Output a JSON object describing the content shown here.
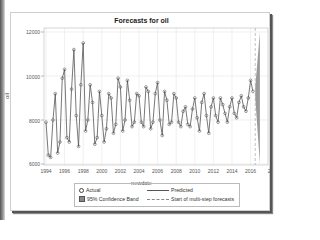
{
  "chart_data": {
    "type": "line",
    "title": "Forecasts for oil",
    "xlabel": "newdate",
    "ylabel": "oil",
    "ylim": [
      6000,
      12000
    ],
    "xlim": [
      1994,
      2018
    ],
    "y_ticks": [
      "6000",
      "8000",
      "10000",
      "12000"
    ],
    "x_ticks": [
      "1994",
      "1996",
      "1998",
      "2000",
      "2002",
      "2004",
      "2006",
      "2008",
      "2010",
      "2012",
      "2014",
      "2016",
      "2"
    ],
    "grid": true,
    "legend_position": "bottom",
    "legend": [
      "Actual",
      "Predicted",
      "95% Confidence Band",
      "Start of multi-step forecasts"
    ],
    "series": [
      {
        "name": "Actual",
        "style": "circle-markers",
        "x": [
          1994.0,
          1994.25,
          1994.5,
          1994.75,
          1995.0,
          1995.25,
          1995.5,
          1995.75,
          1996.0,
          1996.25,
          1996.5,
          1996.75,
          1997.0,
          1997.25,
          1997.5,
          1997.75,
          1998.0,
          1998.25,
          1998.5,
          1998.75,
          1999.0,
          1999.25,
          1999.5,
          1999.75,
          2000.0,
          2000.25,
          2000.5,
          2000.75,
          2001.0,
          2001.25,
          2001.5,
          2001.75,
          2002.0,
          2002.25,
          2002.5,
          2002.75,
          2003.0,
          2003.25,
          2003.5,
          2003.75,
          2004.0,
          2004.25,
          2004.5,
          2004.75,
          2005.0,
          2005.25,
          2005.5,
          2005.75,
          2006.0,
          2006.25,
          2006.5,
          2006.75,
          2007.0,
          2007.25,
          2007.5,
          2007.75,
          2008.0,
          2008.25,
          2008.5,
          2008.75,
          2009.0,
          2009.25,
          2009.5,
          2009.75,
          2010.0,
          2010.25,
          2010.5,
          2010.75,
          2011.0,
          2011.25,
          2011.5,
          2011.75,
          2012.0,
          2012.25,
          2012.5,
          2012.75,
          2013.0,
          2013.25,
          2013.5,
          2013.75,
          2014.0,
          2014.25,
          2014.5,
          2014.75,
          2015.0,
          2015.25,
          2015.5,
          2015.75,
          2016.0,
          2016.25
        ],
        "values": [
          7900,
          6400,
          6300,
          8000,
          9200,
          6500,
          7000,
          9900,
          10300,
          7200,
          7000,
          9400,
          11200,
          8200,
          6800,
          9600,
          11500,
          7500,
          8000,
          9600,
          8800,
          6900,
          7200,
          9300,
          8200,
          7000,
          7600,
          9200,
          9000,
          7400,
          7800,
          9900,
          9500,
          7500,
          8000,
          9800,
          8900,
          7700,
          7900,
          9200,
          9100,
          7900,
          7700,
          9500,
          9300,
          7600,
          7900,
          9200,
          9700,
          8000,
          7300,
          9300,
          8900,
          7800,
          7900,
          9200,
          9000,
          7900,
          7700,
          8400,
          8600,
          7800,
          7700,
          8500,
          9000,
          8100,
          7500,
          8800,
          9200,
          8200,
          7400,
          8600,
          9000,
          8200,
          7900,
          9000,
          8700,
          8300,
          7900,
          8600,
          9000,
          8300,
          8100,
          8800,
          9100,
          8600,
          8400,
          9000,
          9800,
          9300
        ]
      },
      {
        "name": "Predicted",
        "style": "line",
        "note": "follows actual series closely"
      },
      {
        "name": "95% Confidence Band",
        "style": "band",
        "forecast_x": [
          2016.5,
          2017.0
        ],
        "upper": [
          9500,
          12000
        ],
        "lower": [
          9000,
          6000
        ]
      }
    ],
    "annotations": [
      {
        "type": "vline",
        "style": "dashed",
        "x": 2016.5,
        "label": "Start of multi-step forecasts"
      }
    ]
  },
  "legend": {
    "actual": "Actual",
    "predicted": "Predicted",
    "band": "95% Confidence Band",
    "start": "Start of multi-step forecasts"
  },
  "colors": {
    "line": "#555555",
    "marker": "#444444",
    "band": "#888888",
    "grid": "#e6e6e6",
    "vline": "#aaaaaa"
  }
}
